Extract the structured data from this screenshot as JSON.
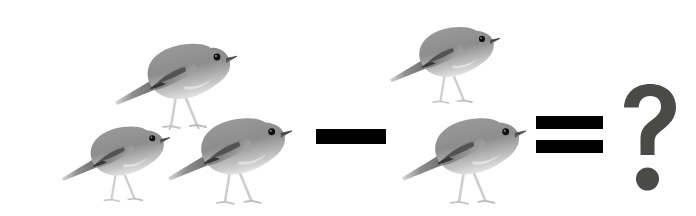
{
  "scene": {
    "title": "Bird subtraction picture puzzle",
    "background_color": "#ffffff",
    "width": 696,
    "height": 216,
    "description": "Three grey birds minus one grey bird equals question mark"
  },
  "equation": {
    "minuend_label": "3",
    "subtrahend_label": "1",
    "result_label": "?",
    "expression": "3 - 1 = ?",
    "minus_sign": "−",
    "equals_sign": "=",
    "question_mark": "?"
  },
  "colors": {
    "background": "#ffffff",
    "operator": "#000000",
    "question_mark": "#4a4a48",
    "bird_body": "#8f8f8f",
    "bird_belly": "#d8d8d8",
    "bird_wing_dark": "#3a3a3a",
    "bird_eye": "#101010",
    "bird_beak": "#5a5a5a",
    "bird_leg": "#c9c9c9"
  },
  "birds": [
    {
      "name": "bird-1",
      "group": "minuend",
      "x": 113,
      "y": 22,
      "w": 124,
      "h": 110,
      "scale": 1.0,
      "alt": "grey bird facing right"
    },
    {
      "name": "bird-2",
      "group": "minuend",
      "x": 60,
      "y": 104,
      "w": 110,
      "h": 104,
      "scale": 0.9,
      "alt": "grey bird facing right"
    },
    {
      "name": "bird-3",
      "group": "minuend",
      "x": 166,
      "y": 96,
      "w": 126,
      "h": 112,
      "scale": 1.0,
      "alt": "grey bird facing right"
    },
    {
      "name": "bird-4",
      "group": "subtrahend",
      "x": 388,
      "y": 4,
      "w": 112,
      "h": 106,
      "scale": 0.92,
      "alt": "grey bird facing right"
    },
    {
      "name": "bird-5",
      "group": "subtrahend",
      "x": 400,
      "y": 96,
      "w": 126,
      "h": 112,
      "scale": 1.0,
      "alt": "grey bird facing right"
    }
  ],
  "operators": {
    "minus": {
      "x": 316,
      "y": 129,
      "w": 70,
      "h": 15
    },
    "equals": {
      "x": 536,
      "top_y": 116,
      "bottom_y": 140,
      "w": 67,
      "h": 13
    },
    "question": {
      "x": 620,
      "y": 82,
      "w": 62,
      "h": 110
    }
  }
}
